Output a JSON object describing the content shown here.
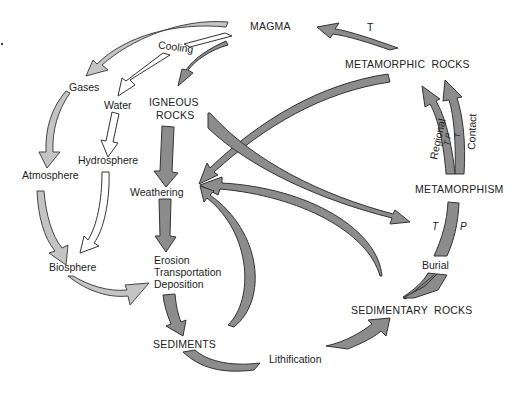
{
  "colors": {
    "rock_arrow": "#8c8c8c",
    "atmosphere_arrow": "#c4c4c4",
    "water_arrow": "#ffffff",
    "outline": "#333333",
    "text": "#222222"
  },
  "nodes": {
    "magma": "MAGMA",
    "metamorphic_rocks": "METAMORPHIC  ROCKS",
    "igneous_line1": "IGNEOUS",
    "igneous_line2": "ROCKS",
    "gases": "Gases",
    "water": "Water",
    "cooling": "Cooling",
    "hydrosphere": "Hydrosphere",
    "atmosphere": "Atmosphere",
    "weathering": "Weathering",
    "biosphere": "Biosphere",
    "erosion": "Erosion",
    "transportation": "Transportation",
    "deposition": "Deposition",
    "sediments": "SEDIMENTS",
    "lithification": "Lithification",
    "sedimentary_rocks": "SEDIMENTARY  ROCKS",
    "metamorphism": "METAMORPHISM",
    "burial": "Burial"
  },
  "arrow_labels": {
    "melt_t": "T",
    "regional": "Regional",
    "contact": "Contact",
    "regional_tp": "T P",
    "contact_t": "T",
    "burial_t": "T",
    "burial_p": "P"
  },
  "flows": [
    {
      "from": "MAGMA",
      "to": "Gases",
      "style": "light"
    },
    {
      "from": "MAGMA",
      "to": "Water",
      "label": "Cooling",
      "style": "white"
    },
    {
      "from": "MAGMA",
      "to": "IGNEOUS ROCKS",
      "style": "dark"
    },
    {
      "from": "Gases",
      "to": "Atmosphere",
      "style": "light"
    },
    {
      "from": "Water",
      "to": "Hydrosphere",
      "style": "white"
    },
    {
      "from": "Hydrosphere",
      "to": "Biosphere",
      "style": "white"
    },
    {
      "from": "Atmosphere",
      "to": "Biosphere",
      "style": "light"
    },
    {
      "from": "Biosphere",
      "to": "Erosion Transportation Deposition",
      "style": "light"
    },
    {
      "from": "IGNEOUS ROCKS",
      "to": "Weathering",
      "style": "dark"
    },
    {
      "from": "IGNEOUS ROCKS",
      "to": "METAMORPHISM",
      "style": "dark"
    },
    {
      "from": "METAMORPHIC ROCKS",
      "to": "Weathering",
      "style": "dark"
    },
    {
      "from": "METAMORPHIC ROCKS",
      "to": "MAGMA",
      "label": "T",
      "style": "dark"
    },
    {
      "from": "Weathering",
      "to": "Erosion Transportation Deposition",
      "style": "dark"
    },
    {
      "from": "Erosion Transportation Deposition",
      "to": "SEDIMENTS",
      "style": "dark"
    },
    {
      "from": "SEDIMENTS",
      "to": "Weathering",
      "style": "dark"
    },
    {
      "from": "SEDIMENTARY ROCKS",
      "to": "Weathering",
      "style": "dark"
    },
    {
      "from": "SEDIMENTS",
      "to": "SEDIMENTARY ROCKS",
      "label": "Lithification",
      "style": "dark"
    },
    {
      "from": "SEDIMENTARY ROCKS",
      "to": "METAMORPHISM",
      "label": "Burial (T, P)",
      "style": "dark"
    },
    {
      "from": "METAMORPHISM",
      "to": "METAMORPHIC ROCKS",
      "label": "Regional (T P)",
      "style": "dark"
    },
    {
      "from": "METAMORPHISM",
      "to": "METAMORPHIC ROCKS",
      "label": "Contact (T)",
      "style": "dark"
    }
  ]
}
